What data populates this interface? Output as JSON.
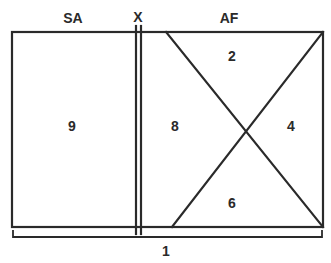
{
  "diagram": {
    "top_labels": {
      "left": "SA",
      "divider": "X",
      "right": "AF"
    },
    "regions": {
      "left_panel": "9",
      "right_left_triangle": "8",
      "right_top_triangle": "2",
      "right_right_triangle": "4",
      "right_bottom_triangle": "6"
    },
    "bracket_label": "1",
    "line_color": "#2a2a2a"
  }
}
